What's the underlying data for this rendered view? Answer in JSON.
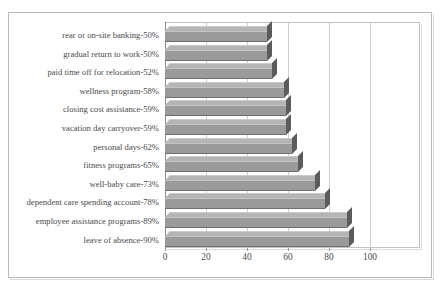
{
  "chart": {
    "title": "",
    "title_note": "clipped-at-top-edge",
    "frame": {
      "plot_left_px": 165,
      "plot_top_px": 22,
      "plot_width_px": 255,
      "plot_height_px": 226,
      "px_per_unit": 2.05
    }
  },
  "chart_data": {
    "type": "bar",
    "orientation": "horizontal",
    "title": "",
    "xlabel": "",
    "ylabel": "",
    "xlim": [
      0,
      110
    ],
    "grid": "vertical",
    "legend": "none",
    "style": "3d-bar-gray",
    "xticks": [
      0,
      20,
      40,
      60,
      80,
      100
    ],
    "categories": [
      "rear or on-site banking-50%",
      "gradual return to work-50%",
      "paid time off for relocation-52%",
      "wellness program-58%",
      "closing cost assistance-59%",
      "vacation day carryover-59%",
      "personal days-62%",
      "fitness programs-65%",
      "well-baby care-73%",
      "dependent care spending account-78%",
      "employee assistance programs-89%",
      "leave of absence-90%"
    ],
    "values": [
      50,
      50,
      52,
      58,
      59,
      59,
      62,
      65,
      73,
      78,
      89,
      90
    ],
    "colors": {
      "bar_face": "#9a9a9a",
      "bar_top": "#b5b5b5",
      "bar_cap": "#5b5b5b",
      "gridline": "#cfcfcf",
      "axis": "#8c8c8c",
      "frame": "#b9b9b9",
      "text": "#4a4a4a",
      "background": "#ffffff"
    }
  }
}
